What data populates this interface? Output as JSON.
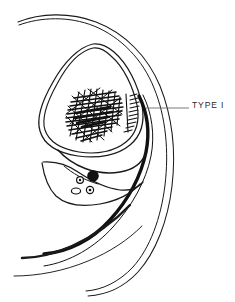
{
  "figure": {
    "background_color": "#ffffff",
    "ink_color": "#1a1a1a",
    "leader_line_color": "#6b6b6b",
    "annotations": [
      {
        "id": "type-i",
        "label": "TYPE I",
        "leader_from_x": 146,
        "leader_from_y": 108,
        "leader_to_x": 189,
        "leader_to_y": 108,
        "text_x": 192,
        "text_y": 101
      }
    ],
    "structures": [
      {
        "name": "outer-body-contour",
        "description": "Outer double-line body wall contour sweeping from upper left across the top, down the right side and curving to lower left",
        "stroke_width": 1.0
      },
      {
        "name": "inner-cavity-outline",
        "description": "Double-walled teardrop shaped cavity occupying upper-left central region",
        "stroke_width": 1.2
      },
      {
        "name": "lesion-mass",
        "description": "Dense cross-hatched scribbled mass inside the cavity representing a Type I lesion",
        "fill": "hatched"
      },
      {
        "name": "thick-black-band",
        "description": "Heavy black curved band running along the right inner margin and down toward lower left",
        "stroke_width": 3.5
      },
      {
        "name": "vessel-bundle",
        "description": "Lower-left neurovascular bundle containing one large filled circle and three small ringed circles",
        "vessel_count": 4
      }
    ],
    "vessels": [
      {
        "name": "large-filled-vessel",
        "cx": 93,
        "cy": 176,
        "r": 5.2,
        "fill": "solid"
      },
      {
        "name": "ringed-vessel-left",
        "cx": 80,
        "cy": 180,
        "r": 3.4,
        "fill": "ring"
      },
      {
        "name": "ringed-vessel-lower",
        "cx": 90,
        "cy": 190,
        "r": 3.6,
        "fill": "ring"
      },
      {
        "name": "open-vessel-oval",
        "cx": 77,
        "cy": 191,
        "r": 4.0,
        "fill": "open"
      }
    ]
  }
}
